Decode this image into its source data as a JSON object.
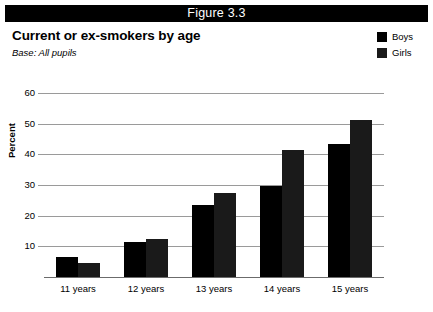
{
  "figure": {
    "banner_label": "Figure 3.3"
  },
  "header": {
    "title": "Current or ex-smokers by age",
    "base_note": "Base: All pupils"
  },
  "legend": {
    "position": "top-right",
    "items": [
      {
        "label": "Boys",
        "color": "#000000",
        "swatch_name": "legend-swatch-boys"
      },
      {
        "label": "Girls",
        "color": "#1a1a1a",
        "swatch_name": "legend-swatch-girls"
      }
    ]
  },
  "colors": {
    "boys": "#000000",
    "girls": "#1a1a1a",
    "gridline": "#9a9a9a",
    "axis": "#6b6b6b",
    "banner_bg": "#000000",
    "banner_text": "#ffffff",
    "background": "#ffffff"
  },
  "chart_data": {
    "type": "bar",
    "title": "Current or ex-smokers by age",
    "subtitle": "Base: All pupils",
    "xlabel": "",
    "ylabel": "Percent",
    "categories": [
      "11 years",
      "12 years",
      "13 years",
      "14 years",
      "15 years"
    ],
    "series": [
      {
        "name": "Boys",
        "color": "#000000",
        "values": [
          6.5,
          11.5,
          23.5,
          29.8,
          43.3
        ]
      },
      {
        "name": "Girls",
        "color": "#1a1a1a",
        "values": [
          4.5,
          12.5,
          27.5,
          41.5,
          51.2
        ]
      }
    ],
    "ylim": [
      0,
      60
    ],
    "yticks": [
      10,
      20,
      30,
      40,
      50,
      60
    ],
    "ytick_labels": [
      "10",
      "20",
      "30",
      "40",
      "50",
      "60"
    ],
    "grid": true,
    "legend_position": "top-right"
  }
}
